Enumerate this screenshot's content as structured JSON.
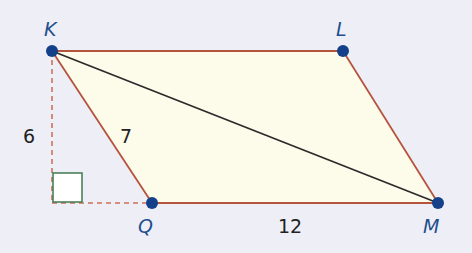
{
  "diagram": {
    "type": "parallelogram",
    "colors": {
      "background": "#eeeef6",
      "fill": "#fdfbea",
      "edge": "#b5533c",
      "diagonal": "#2b2b2b",
      "dashed": "#d0705a",
      "right_angle": "#3f7a4f",
      "vertex": "#14408a",
      "vertex_label": "#1f4e8c",
      "measure_label": "#222222"
    },
    "vertices": {
      "K": {
        "label": "K",
        "x": 52,
        "y": 51
      },
      "L": {
        "label": "L",
        "x": 343,
        "y": 51
      },
      "M": {
        "label": "M",
        "x": 438,
        "y": 203
      },
      "Q": {
        "label": "Q",
        "x": 152,
        "y": 203
      }
    },
    "edges": [
      "KL",
      "LM",
      "MQ",
      "QK"
    ],
    "diagonal": "KM",
    "height_foot": {
      "x": 52,
      "y": 203
    },
    "measurements": {
      "height": "6",
      "KQ": "7",
      "QM": "12"
    }
  }
}
